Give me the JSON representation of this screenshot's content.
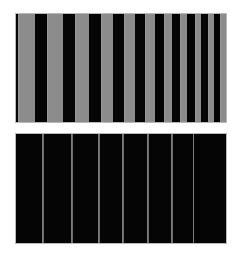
{
  "figure": {
    "name": "vertical-grating-pattern-pair",
    "canvas_width": 240,
    "canvas_height": 262,
    "background_color": "#ffffff"
  },
  "chart_data": {
    "type": "bar",
    "title": "",
    "subtitle": "",
    "xlabel": "",
    "ylabel": "",
    "grid": false,
    "legend": false,
    "panels": [
      {
        "id": "panel-top",
        "name": "coarse-grating-panel",
        "background_color": "#050505",
        "bar_color": "#8c8c8c",
        "border_color": "#b9b9b9",
        "x": 15,
        "y": 13,
        "width": 212,
        "height": 110,
        "bar_count": 11,
        "categories": [
          "b1",
          "b2",
          "b3",
          "b4",
          "b5",
          "b6",
          "b7",
          "b8",
          "b9",
          "b10",
          "b11"
        ],
        "values": [
          100,
          100,
          100,
          100,
          100,
          100,
          100,
          100,
          100,
          100,
          100
        ],
        "bars": [
          {
            "left": 2,
            "width": 17
          },
          {
            "left": 31,
            "width": 16
          },
          {
            "left": 59,
            "width": 14
          },
          {
            "left": 85,
            "width": 12
          },
          {
            "left": 108,
            "width": 11
          },
          {
            "left": 129,
            "width": 10
          },
          {
            "left": 148,
            "width": 8
          },
          {
            "left": 164,
            "width": 7
          },
          {
            "left": 179,
            "width": 6
          },
          {
            "left": 192,
            "width": 6
          },
          {
            "left": 204,
            "width": 6
          }
        ]
      },
      {
        "id": "panel-bottom",
        "name": "fine-grating-panel",
        "background_color": "#050505",
        "bar_color": "#6d6d6d",
        "border_color": "#b9b9b9",
        "x": 15,
        "y": 133,
        "width": 212,
        "height": 111,
        "bar_count": 7,
        "categories": [
          "l1",
          "l2",
          "l3",
          "l4",
          "l5",
          "l6",
          "l7"
        ],
        "values": [
          100,
          100,
          100,
          100,
          100,
          100,
          100
        ],
        "bars": [
          {
            "left": 26,
            "width": 2
          },
          {
            "left": 55,
            "width": 2
          },
          {
            "left": 82,
            "width": 2
          },
          {
            "left": 106,
            "width": 2
          },
          {
            "left": 131,
            "width": 2
          },
          {
            "left": 155,
            "width": 2
          },
          {
            "left": 177,
            "width": 1
          }
        ]
      }
    ]
  }
}
